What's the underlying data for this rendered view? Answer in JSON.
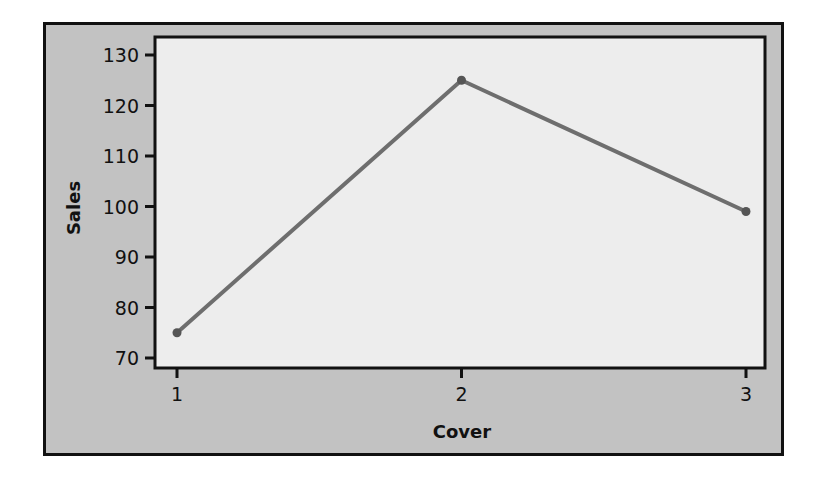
{
  "chart_data": {
    "type": "line",
    "title": "",
    "xlabel": "Cover",
    "ylabel": "Sales",
    "x": [
      1,
      2,
      3
    ],
    "categories": [
      "1",
      "2",
      "3"
    ],
    "series": [
      {
        "name": "Sales",
        "values": [
          75,
          125,
          99
        ]
      }
    ],
    "values": [
      75,
      125,
      99
    ],
    "xticks": [
      "1",
      "2",
      "3"
    ],
    "yticks": [
      70,
      80,
      90,
      100,
      110,
      120,
      130
    ],
    "ylim": [
      68,
      132
    ],
    "xlim": [
      0.92,
      3.07
    ],
    "grid": false,
    "legend": "none",
    "markers": true
  },
  "colors": {
    "frame_background": "#c2c2c2",
    "plot_background": "#ededed",
    "line": "#6e6e6e",
    "marker": "#555555",
    "border": "#111111"
  }
}
